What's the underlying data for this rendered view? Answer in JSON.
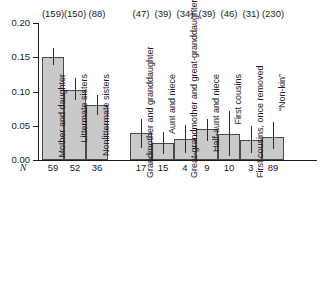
{
  "chart_data": {
    "type": "bar",
    "title": "",
    "xlabel": "",
    "ylabel": "",
    "ylim": [
      0.0,
      0.2
    ],
    "ytick_labels": [
      "0.00",
      "0.05",
      "0.10",
      "0.15",
      "0.20"
    ],
    "ytick_values": [
      0.0,
      0.05,
      0.1,
      0.15,
      0.2
    ],
    "grid": false,
    "legend": "none",
    "n_row_symbol": "N",
    "groups": [
      {
        "name": "close-kin",
        "categories": [
          "Mother and daughter",
          "Littermate sisters",
          "Nonlittermate sisters"
        ],
        "values": [
          0.15,
          0.102,
          0.08
        ],
        "err_low": [
          0.138,
          0.087,
          0.066
        ],
        "err_high": [
          0.164,
          0.12,
          0.095
        ],
        "n": [
          59,
          52,
          36
        ],
        "counts": [
          "(159)",
          "(150)",
          "(88)"
        ]
      },
      {
        "name": "distant-kin",
        "categories": [
          "Grandmother and granddaughter",
          "Aunt and niece",
          "Great-grandmother and great-granddaughter",
          "Half-aunt and niece",
          "First cousins",
          "First cousins, once removed",
          "“Non-kin”"
        ],
        "values": [
          0.04,
          0.025,
          0.031,
          0.046,
          0.038,
          0.029,
          0.034
        ],
        "err_low": [
          0.018,
          0.009,
          0.01,
          0.028,
          0.006,
          0.01,
          0.016
        ],
        "err_high": [
          0.06,
          0.041,
          0.051,
          0.06,
          0.071,
          0.05,
          0.055
        ],
        "n": [
          17,
          15,
          4,
          9,
          10,
          3,
          89
        ],
        "counts": [
          "(47)",
          "(39)",
          "(34)",
          "(39)",
          "(46)",
          "(31)",
          "(230)"
        ]
      }
    ]
  }
}
